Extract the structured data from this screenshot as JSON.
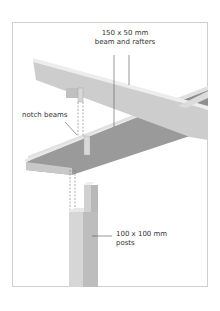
{
  "diagram": {
    "labels": {
      "beam_line1": "150 x 50 mm",
      "beam_line2": "beam and rafters",
      "notch": "notch beams",
      "posts_line1": "100 x 100 mm",
      "posts_line2": "posts"
    },
    "colors": {
      "beam_top": "#e6e6e6",
      "beam_side": "#c9c9c9",
      "rafter_dark": "#8f8f8f",
      "post_front": "#d4d4d4",
      "post_side": "#bdbdbd",
      "frame": "#cfcfcf",
      "leader": "#555555"
    }
  }
}
